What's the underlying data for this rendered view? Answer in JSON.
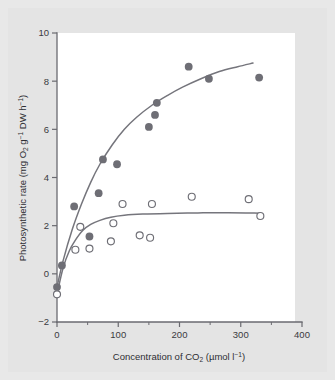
{
  "figure": {
    "background_color": "#e8e8e8",
    "panel_color": "#e4e4e4",
    "plot_color": "#ffffff",
    "ink_color": "#6e6e75"
  },
  "axes": {
    "x_title_main": "Concentration of CO",
    "x_title_sub": "2",
    "x_title_unit_open": " (µmol l",
    "x_title_unit_sup": "−1",
    "x_title_unit_close": ")",
    "y_title_main": "Photosynthetic rate (mg O",
    "y_title_sub": "2",
    "y_title_mid": " g",
    "y_title_sup1": "−1",
    "y_title_mid2": " DW h",
    "y_title_sup2": "−1",
    "y_title_close": ")",
    "x_ticks": [
      "0",
      "100",
      "200",
      "300",
      "400"
    ],
    "y_ticks": [
      "10",
      "8",
      "6",
      "4",
      "2",
      "0",
      "−2"
    ]
  },
  "chart_data": {
    "type": "scatter",
    "title": "",
    "xlabel": "Concentration of CO2 (µmol l-1)",
    "ylabel": "Photosynthetic rate (mg O2 g-1 DW h-1)",
    "xlim": [
      0,
      400
    ],
    "ylim": [
      -2,
      10
    ],
    "x_tick_values": [
      0,
      100,
      200,
      300,
      400
    ],
    "y_tick_values": [
      -2,
      0,
      2,
      4,
      6,
      8,
      10
    ],
    "x_minor_tick_values": [
      50,
      150,
      250,
      350
    ],
    "grid": false,
    "legend": "none",
    "series": [
      {
        "name": "filled-circles",
        "marker": "filled-circle",
        "color": "#6e6e75",
        "points": [
          [
            0,
            -0.55
          ],
          [
            8,
            0.35
          ],
          [
            28,
            2.8
          ],
          [
            53,
            1.55
          ],
          [
            68,
            3.35
          ],
          [
            75,
            4.75
          ],
          [
            98,
            4.55
          ],
          [
            150,
            6.1
          ],
          [
            160,
            6.6
          ],
          [
            163,
            7.1
          ],
          [
            215,
            8.6
          ],
          [
            248,
            8.1
          ],
          [
            330,
            8.15
          ]
        ],
        "fit_curve": [
          [
            0,
            -0.55
          ],
          [
            10,
            0.55
          ],
          [
            25,
            1.85
          ],
          [
            40,
            2.9
          ],
          [
            55,
            3.8
          ],
          [
            70,
            4.55
          ],
          [
            90,
            5.35
          ],
          [
            110,
            6.0
          ],
          [
            130,
            6.5
          ],
          [
            155,
            7.0
          ],
          [
            180,
            7.4
          ],
          [
            205,
            7.75
          ],
          [
            235,
            8.1
          ],
          [
            265,
            8.4
          ],
          [
            295,
            8.6
          ],
          [
            320,
            8.75
          ]
        ]
      },
      {
        "name": "open-circles",
        "marker": "open-circle",
        "color": "#6e6e75",
        "points": [
          [
            0,
            -0.85
          ],
          [
            30,
            1.0
          ],
          [
            38,
            1.95
          ],
          [
            53,
            1.05
          ],
          [
            88,
            1.35
          ],
          [
            92,
            2.1
          ],
          [
            107,
            2.9
          ],
          [
            135,
            1.6
          ],
          [
            152,
            1.5
          ],
          [
            155,
            2.9
          ],
          [
            220,
            3.2
          ],
          [
            313,
            3.1
          ],
          [
            332,
            2.4
          ]
        ],
        "fit_curve": [
          [
            0,
            -0.85
          ],
          [
            10,
            0.25
          ],
          [
            20,
            0.95
          ],
          [
            30,
            1.4
          ],
          [
            42,
            1.8
          ],
          [
            55,
            2.05
          ],
          [
            70,
            2.22
          ],
          [
            88,
            2.35
          ],
          [
            110,
            2.43
          ],
          [
            140,
            2.48
          ],
          [
            180,
            2.51
          ],
          [
            230,
            2.53
          ],
          [
            280,
            2.54
          ],
          [
            332,
            2.52
          ]
        ]
      }
    ]
  }
}
